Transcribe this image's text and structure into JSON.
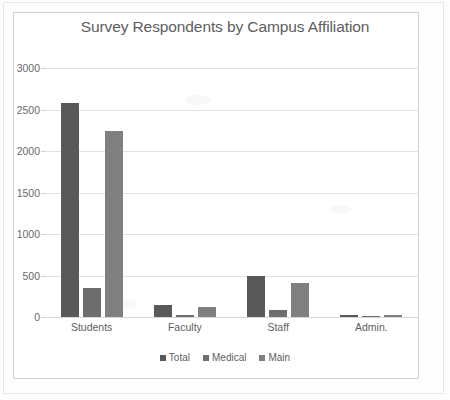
{
  "chart_data": {
    "type": "bar",
    "title": "Survey Respondents by Campus Affiliation",
    "xlabel": "",
    "ylabel": "",
    "categories": [
      "Students",
      "Faculty",
      "Staff",
      "Admin."
    ],
    "series": [
      {
        "name": "Total",
        "values": [
          2580,
          150,
          495,
          30
        ],
        "color": "#595959"
      },
      {
        "name": "Medical",
        "values": [
          348,
          25,
          90,
          5
        ],
        "color": "#6e6e6e"
      },
      {
        "name": "Main",
        "values": [
          2240,
          120,
          410,
          25
        ],
        "color": "#808080"
      }
    ],
    "ylim": [
      0,
      3000
    ],
    "ytick_values": [
      0,
      500,
      1000,
      1500,
      2000,
      2500,
      3000
    ],
    "ytick_labels": [
      "0",
      "500",
      "1000",
      "1500",
      "2000",
      "2500",
      "3000"
    ],
    "grid": true,
    "legend_position": "bottom"
  },
  "legend": {
    "items": [
      {
        "label": "Total",
        "color": "#595959"
      },
      {
        "label": "Medical",
        "color": "#6e6e6e"
      },
      {
        "label": "Main",
        "color": "#808080"
      }
    ]
  },
  "colors": {
    "total": "#595959",
    "medical": "#6e6e6e",
    "main": "#808080",
    "gridline": "#e2e2e2",
    "text": "#5e5e5e",
    "frame": "#d2d2d2",
    "background": "#ffffff"
  }
}
